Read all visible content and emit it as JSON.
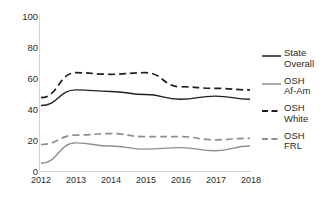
{
  "chart_data": {
    "type": "line",
    "title": "",
    "xlabel": "",
    "ylabel": "",
    "x": [
      "2012",
      "2013",
      "2014",
      "2015",
      "2016",
      "2017",
      "2018"
    ],
    "categories": [
      "2012",
      "2013",
      "2014",
      "2015",
      "2016",
      "2017",
      "2018"
    ],
    "ylim": [
      0,
      100
    ],
    "yticks": [
      0,
      20,
      40,
      60,
      80,
      100
    ],
    "ytick_labels": [
      "0",
      "20",
      "40",
      "60",
      "80",
      "100"
    ],
    "xtick_labels": [
      "2012",
      "2013",
      "2014",
      "2015",
      "2016",
      "2017",
      "2018"
    ],
    "grid": false,
    "legend_position": "right",
    "series": [
      {
        "name": "State Overall",
        "legend_label": "State\nOverall",
        "color": "#231f20",
        "style": "solid",
        "values": [
          42,
          52,
          51,
          49,
          46,
          48,
          46
        ]
      },
      {
        "name": "OSH Af-Am",
        "legend_label": "OSH\nAf-Am",
        "color": "#8e8e8e",
        "style": "solid",
        "values": [
          5,
          18,
          16,
          14,
          15,
          13,
          16
        ]
      },
      {
        "name": "OSH White",
        "legend_label": "OSH\nWhite",
        "color": "#231f20",
        "style": "dashed",
        "values": [
          47,
          63,
          62,
          63,
          54,
          53,
          52
        ]
      },
      {
        "name": "OSH FRL",
        "legend_label": "OSH\nFRL",
        "color": "#8e8e8e",
        "style": "dashed",
        "values": [
          17,
          23,
          24,
          22,
          22,
          20,
          21
        ]
      }
    ]
  },
  "axes": {
    "axis_color": "#d0d0d0",
    "y_label_0": "0",
    "y_label_20": "20",
    "y_label_40": "40",
    "y_label_60": "60",
    "y_label_80": "80",
    "y_label_100": "100",
    "x_label_1": "2012",
    "x_label_2": "2013",
    "x_label_3": "2014",
    "x_label_4": "2015",
    "x_label_5": "2016",
    "x_label_6": "2017",
    "x_label_7": "2018"
  },
  "legend": {
    "items": [
      {
        "label": "State\nOverall",
        "color": "#231f20",
        "style": "solid"
      },
      {
        "label": "OSH\nAf-Am",
        "color": "#8e8e8e",
        "style": "solid"
      },
      {
        "label": "OSH\nWhite",
        "color": "#231f20",
        "style": "dashed"
      },
      {
        "label": "OSH\nFRL",
        "color": "#8e8e8e",
        "style": "dashed"
      }
    ]
  }
}
